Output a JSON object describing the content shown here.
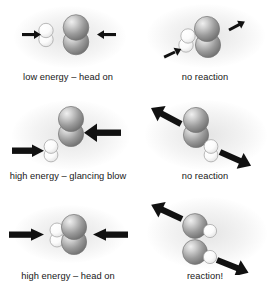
{
  "figure": {
    "background_color": "#ffffff",
    "text_color": "#171717",
    "arrow_color": "#111111",
    "sphere_large_color": "#9a9a9a",
    "sphere_small_color": "#f2f2f2"
  },
  "rows": [
    {
      "id": "row-low-energy-head-on",
      "before": {
        "caption": "low energy – head on",
        "molecules": [
          {
            "name": "hydrogen-molecule",
            "type": "small-white-pair",
            "atoms": 2,
            "color": "#f5f5f5"
          },
          {
            "name": "iodine-molecule",
            "type": "large-gray-pair",
            "atoms": 2,
            "color": "#9a9a9a"
          }
        ],
        "arrows": [
          {
            "name": "arrow-right-thin",
            "direction": "right",
            "weight": "thin"
          },
          {
            "name": "arrow-left-thin",
            "direction": "left",
            "weight": "thin"
          }
        ]
      },
      "after": {
        "caption": "no reaction",
        "molecules": [
          {
            "name": "hydrogen-molecule",
            "type": "small-white-pair",
            "atoms": 2,
            "color": "#f5f5f5"
          },
          {
            "name": "iodine-molecule",
            "type": "large-gray-pair",
            "atoms": 2,
            "color": "#9a9a9a"
          }
        ],
        "arrows": [
          {
            "name": "arrow-down-left-thin",
            "direction": "down-left",
            "weight": "thin"
          },
          {
            "name": "arrow-up-right-thin",
            "direction": "up-right",
            "weight": "thin"
          }
        ]
      }
    },
    {
      "id": "row-high-energy-glancing-blow",
      "before": {
        "caption": "high energy – glancing blow",
        "molecules": [
          {
            "name": "hydrogen-molecule",
            "type": "small-white-pair",
            "atoms": 2,
            "color": "#f5f5f5"
          },
          {
            "name": "iodine-molecule",
            "type": "large-gray-pair",
            "atoms": 2,
            "color": "#9a9a9a"
          }
        ],
        "arrows": [
          {
            "name": "arrow-right-thick",
            "direction": "right",
            "weight": "thick"
          },
          {
            "name": "arrow-left-thick",
            "direction": "left",
            "weight": "thick"
          }
        ]
      },
      "after": {
        "caption": "no reaction",
        "molecules": [
          {
            "name": "iodine-molecule",
            "type": "large-gray-pair",
            "atoms": 2,
            "color": "#9a9a9a"
          },
          {
            "name": "hydrogen-molecule",
            "type": "small-white-pair",
            "atoms": 2,
            "color": "#f5f5f5"
          }
        ],
        "arrows": [
          {
            "name": "arrow-up-left-thick",
            "direction": "up-left",
            "weight": "thick"
          },
          {
            "name": "arrow-down-right-thick",
            "direction": "down-right",
            "weight": "thick"
          }
        ]
      }
    },
    {
      "id": "row-high-energy-head-on",
      "before": {
        "caption": "high energy – head on",
        "molecules": [
          {
            "name": "hydrogen-molecule",
            "type": "small-white-pair",
            "atoms": 2,
            "color": "#f5f5f5"
          },
          {
            "name": "iodine-molecule",
            "type": "large-gray-pair",
            "atoms": 2,
            "color": "#9a9a9a"
          }
        ],
        "arrows": [
          {
            "name": "arrow-right-thick",
            "direction": "right",
            "weight": "thick"
          },
          {
            "name": "arrow-left-thick",
            "direction": "left",
            "weight": "thick"
          }
        ]
      },
      "after": {
        "caption": "reaction!",
        "molecules": [
          {
            "name": "hydrogen-iodide-molecule",
            "type": "gray-plus-white",
            "atoms": 2,
            "color": "#9a9a9a"
          },
          {
            "name": "hydrogen-iodide-molecule",
            "type": "gray-plus-white",
            "atoms": 2,
            "color": "#9a9a9a"
          }
        ],
        "arrows": [
          {
            "name": "arrow-up-left-thick",
            "direction": "up-left",
            "weight": "thick"
          },
          {
            "name": "arrow-down-right-thick",
            "direction": "down-right",
            "weight": "thick"
          }
        ]
      }
    }
  ]
}
